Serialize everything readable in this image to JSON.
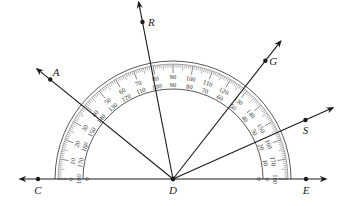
{
  "diagram": {
    "type": "protractor-angle-diagram",
    "center": {
      "label": "D",
      "x": 173,
      "y": 179
    },
    "baseline": {
      "x1": 20,
      "x2": 326,
      "y": 179
    },
    "protractor": {
      "outer_radius": 118,
      "inner_radius": 90,
      "outer_scale": [
        0,
        10,
        20,
        30,
        40,
        50,
        60,
        70,
        80,
        90,
        100,
        110,
        120,
        130,
        140,
        150,
        160,
        170,
        180
      ],
      "inner_scale": [
        180,
        170,
        160,
        150,
        140,
        130,
        120,
        110,
        100,
        90,
        80,
        70,
        60,
        50,
        40,
        30,
        20,
        10,
        0
      ]
    },
    "rays": [
      {
        "label": "E",
        "angle_deg": 0,
        "length": 153,
        "point_dist": 133,
        "label_dx": 0,
        "label_dy": 15
      },
      {
        "label": "S",
        "angle_deg": 24,
        "length": 175,
        "point_dist": 145,
        "label_dx": 0,
        "label_dy": 14
      },
      {
        "label": "G",
        "angle_deg": 52,
        "length": 175,
        "point_dist": 150,
        "label_dx": 8,
        "label_dy": 4
      },
      {
        "label": "R",
        "angle_deg": 101,
        "length": 180,
        "point_dist": 160,
        "label_dx": 9,
        "label_dy": 4
      },
      {
        "label": "A",
        "angle_deg": 141,
        "length": 175,
        "point_dist": 158,
        "label_dx": 6,
        "label_dy": -4
      },
      {
        "label": "C",
        "angle_deg": 180,
        "length": 153,
        "point_dist": 135,
        "label_dx": 0,
        "label_dy": 15
      }
    ],
    "labels": {
      "center": "D"
    }
  },
  "colors": {
    "line": "#1a1a1a",
    "scale": "#444444"
  }
}
